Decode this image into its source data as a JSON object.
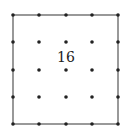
{
  "diagram": {
    "type": "dot-grid-square",
    "grid": {
      "columns": 5,
      "rows": 5
    },
    "x_positions": [
      13,
      39,
      66,
      92,
      118
    ],
    "y_positions": [
      15,
      42,
      70,
      97,
      124
    ],
    "square": {
      "x1": 13,
      "y1": 15,
      "x2": 118,
      "y2": 124
    },
    "label": {
      "text": "16",
      "x": 66,
      "y": 57
    },
    "colors": {
      "line": "#555555",
      "dot": "#222222",
      "background": "#ffffff"
    }
  }
}
